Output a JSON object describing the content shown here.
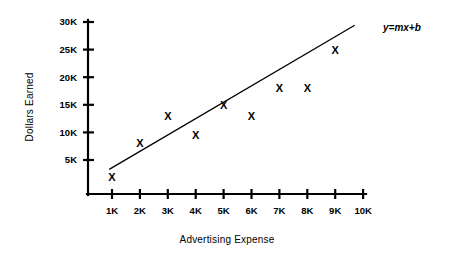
{
  "chart_data": {
    "type": "scatter",
    "title": "",
    "xlabel": "Advertising Expense",
    "ylabel": "Dollars Earned",
    "xlim": [
      0,
      10000
    ],
    "ylim": [
      0,
      30000
    ],
    "grid": false,
    "legend": null,
    "x_tick_labels": [
      "1K",
      "2K",
      "3K",
      "4K",
      "5K",
      "6K",
      "7K",
      "8K",
      "9K",
      "10K"
    ],
    "x_tick_values": [
      1000,
      2000,
      3000,
      4000,
      5000,
      6000,
      7000,
      8000,
      9000,
      10000
    ],
    "y_tick_labels": [
      "5K",
      "10K",
      "15K",
      "20K",
      "25K",
      "30K"
    ],
    "y_tick_values": [
      5000,
      10000,
      15000,
      20000,
      25000,
      30000
    ],
    "marker_glyph": "X",
    "points": [
      {
        "x": 1000,
        "y": 2000
      },
      {
        "x": 2000,
        "y": 8000
      },
      {
        "x": 3000,
        "y": 13000
      },
      {
        "x": 4000,
        "y": 9500
      },
      {
        "x": 5000,
        "y": 15000
      },
      {
        "x": 6000,
        "y": 13000
      },
      {
        "x": 7000,
        "y": 18000
      },
      {
        "x": 8000,
        "y": 18000
      },
      {
        "x": 9000,
        "y": 25000
      }
    ],
    "trendline": {
      "label": "y=mx+b",
      "x_start": 900,
      "y_start": 3300,
      "x_end": 9700,
      "y_end": 29400
    },
    "colors": {
      "axis": "#000000",
      "marker": "#000000",
      "trendline": "#000000",
      "background": "#ffffff"
    }
  }
}
